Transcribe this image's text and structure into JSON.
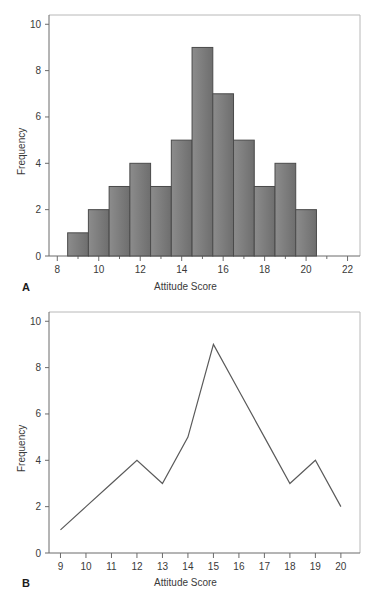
{
  "figure": {
    "panels": [
      {
        "letter": "A",
        "xlabel": "Attitude Score",
        "ylabel": "Frequency"
      },
      {
        "letter": "B",
        "xlabel": "Attitude Score",
        "ylabel": "Frequency"
      }
    ]
  },
  "colors": {
    "bar_fill_light": "#8c8c8c",
    "bar_fill_dark": "#6e6e6e",
    "bar_stroke": "#4a4a4a",
    "line_stroke": "#5a5a5a",
    "axis": "#6b6b6b",
    "frame": "#b8b8b8",
    "text": "#3a3a3a",
    "background": "#ffffff"
  },
  "chart_data": [
    {
      "type": "bar",
      "title": "",
      "panel": "A",
      "xlabel": "Attitude Score",
      "ylabel": "Frequency",
      "categories": [
        9,
        10,
        11,
        12,
        13,
        14,
        15,
        16,
        17,
        18,
        19,
        20
      ],
      "values": [
        1,
        2,
        3,
        4,
        3,
        5,
        9,
        7,
        5,
        3,
        4,
        2
      ],
      "bar_width": 1,
      "xlim": [
        7.6,
        22.6
      ],
      "ylim": [
        0,
        10.4
      ],
      "xticks": [
        8,
        10,
        12,
        14,
        16,
        18,
        20,
        22
      ],
      "xticklabels": [
        "8",
        "10",
        "12",
        "14",
        "16",
        "18",
        "20",
        "22"
      ],
      "xminorticks": [
        9,
        11,
        13,
        15,
        17,
        19,
        21
      ],
      "yticks": [
        0,
        2,
        4,
        6,
        8,
        10
      ],
      "yticklabels": [
        "0",
        "2",
        "4",
        "6",
        "8",
        "10"
      ],
      "grid": false,
      "legend": null
    },
    {
      "type": "line",
      "title": "",
      "panel": "B",
      "xlabel": "Attitude Score",
      "ylabel": "Frequency",
      "x": [
        9,
        10,
        11,
        12,
        13,
        14,
        15,
        16,
        17,
        18,
        19,
        20
      ],
      "values": [
        1,
        2,
        3,
        4,
        3,
        5,
        9,
        7,
        5,
        3,
        4,
        2
      ],
      "xlim": [
        8.55,
        20.75
      ],
      "ylim": [
        0,
        10.4
      ],
      "xticks": [
        9,
        10,
        11,
        12,
        13,
        14,
        15,
        16,
        17,
        18,
        19,
        20
      ],
      "xticklabels": [
        "9",
        "10",
        "11",
        "12",
        "13",
        "14",
        "15",
        "16",
        "17",
        "18",
        "19",
        "20"
      ],
      "yticks": [
        0,
        2,
        4,
        6,
        8,
        10
      ],
      "yticklabels": [
        "0",
        "2",
        "4",
        "6",
        "8",
        "10"
      ],
      "grid": false,
      "legend": null
    }
  ]
}
